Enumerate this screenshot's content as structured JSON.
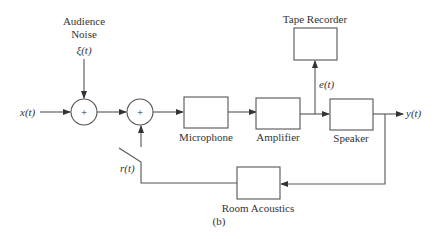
{
  "diagram": {
    "caption": "(b)",
    "source": {
      "label": "Audience",
      "label2": "Noise",
      "signal": "ξ(t)"
    },
    "input": "x(t)",
    "output": "y(t)",
    "sum1": {
      "symbol": "+"
    },
    "sum2": {
      "symbol": "+"
    },
    "blocks": {
      "microphone": "Microphone",
      "amplifier": "Amplifier",
      "speaker": "Speaker",
      "tape_recorder": "Tape Recorder",
      "room_acoustics": "Room Acoustics"
    },
    "signals": {
      "tape_signal": "e(t)",
      "feedback_signal": "r(t)"
    },
    "colors": {
      "line": "#555555",
      "text": "#333333"
    }
  }
}
